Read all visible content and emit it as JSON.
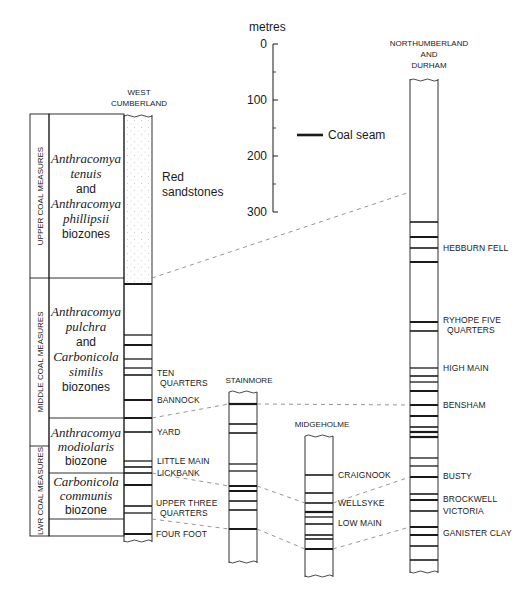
{
  "scale": {
    "unit_label": "metres",
    "ticks": [
      "0",
      "100",
      "200",
      "300"
    ]
  },
  "legend": {
    "coal_seam_label": "Coal seam"
  },
  "measures": {
    "upper": "UPPER COAL MEASURES",
    "middle": "MIDDLE COAL MEASURES",
    "lower": "LWR COAL MEASURES"
  },
  "biozones": {
    "upper": {
      "line1": "Anthracomya",
      "line2": "tenuis",
      "line3": "and",
      "line4": "Anthracomya",
      "line5": "phillipsii",
      "line6": "biozones"
    },
    "middle": {
      "line1": "Anthracomya",
      "line2": "pulchra",
      "line3": "and",
      "line4": "Carbonicola",
      "line5": "similis",
      "line6": "biozones"
    },
    "modiolaris": {
      "line1": "Anthracomya",
      "line2": "modiolaris",
      "line3": "biozone"
    },
    "communis": {
      "line1": "Carbonicola",
      "line2": "communis",
      "line3": "biozone"
    }
  },
  "columns": {
    "west_cumberland": {
      "title1": "WEST",
      "title2": "CUMBERLAND",
      "red_sandstones1": "Red",
      "red_sandstones2": "sandstones",
      "seams": {
        "ten_quarters1": "TEN",
        "ten_quarters2": "QUARTERS",
        "bannock": "BANNOCK",
        "yard": "YARD",
        "little_main": "LITTLE MAIN",
        "lickbank": "LICKBANK",
        "upper_three_quarters1": "UPPER THREE",
        "upper_three_quarters2": "QUARTERS",
        "four_foot": "FOUR FOOT"
      }
    },
    "stainmore": {
      "title": "STAINMORE"
    },
    "midgeholme": {
      "title": "MIDGEHOLME",
      "seams": {
        "craignook": "CRAIGNOOK",
        "wellsyke": "WELLSYKE",
        "low_main": "LOW MAIN"
      }
    },
    "northumberland": {
      "title1": "NORTHUMBERLAND",
      "title2": "AND",
      "title3": "DURHAM",
      "seams": {
        "hebburn_fell": "HEBBURN FELL",
        "ryhope1": "RYHOPE FIVE",
        "ryhope2": "QUARTERS",
        "high_main": "HIGH MAIN",
        "bensham": "BENSHAM",
        "busty": "BUSTY",
        "brockwell": "BROCKWELL",
        "victoria": "VICTORIA",
        "ganister_clay": "GANISTER CLAY"
      }
    }
  },
  "colors": {
    "ink": "#1a1a1a",
    "dash": "#8a8a8a",
    "stipple": "#b8b8b8"
  }
}
